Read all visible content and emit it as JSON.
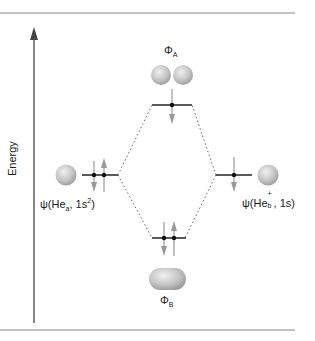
{
  "diagram": {
    "type": "molecular-orbital-energy-diagram",
    "axis": {
      "label": "Energy",
      "direction": "up"
    },
    "orbitals": {
      "antibonding": {
        "symbol": "Φ",
        "subscript": "A",
        "electrons": 1,
        "spins": [
          "down"
        ]
      },
      "bonding": {
        "symbol": "Φ",
        "subscript": "B",
        "electrons": 2,
        "spins": [
          "down",
          "up"
        ]
      },
      "left_atomic": {
        "prefix": "ψ(He",
        "subscript": "a",
        "middle": ", 1s",
        "superscript": "2",
        "suffix": ")",
        "electrons": 2,
        "spins": [
          "down",
          "up"
        ]
      },
      "right_atomic": {
        "prefix": "ψ(He",
        "subscript": "b",
        "superscript": "+",
        "middle": ", 1s",
        "suffix": ")",
        "electrons": 1,
        "spins": [
          "down"
        ]
      }
    },
    "colors": {
      "sphere": "#c8c8c8",
      "line": "#333333",
      "arrow": "#999999",
      "rule": "#888888",
      "dotted": "#666666"
    }
  }
}
